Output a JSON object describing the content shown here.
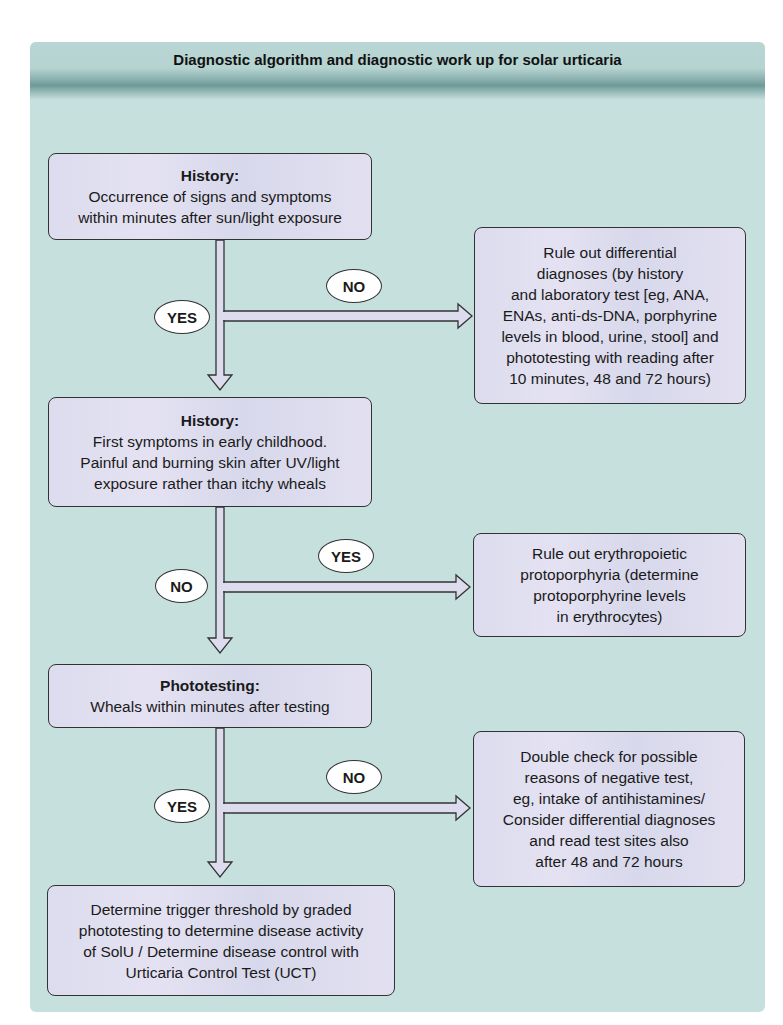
{
  "title": "Diagnostic algorithm and diagnostic work up for solar urticaria",
  "steps": [
    {
      "heading": "History:",
      "lines": [
        "Occurrence of signs and symptoms",
        "within minutes after sun/light exposure"
      ]
    },
    {
      "heading": "History:",
      "lines": [
        "First symptoms in early childhood.",
        "Painful and burning skin after UV/light",
        "exposure rather than itchy wheals"
      ]
    },
    {
      "heading": "Phototesting:",
      "lines": [
        "Wheals within minutes after testing"
      ]
    },
    {
      "heading": "",
      "lines": [
        "Determine trigger threshold by graded",
        "phototesting to determine disease activity",
        "of SolU / Determine disease control with",
        "Urticaria Control Test (UCT)"
      ]
    }
  ],
  "side_boxes": [
    {
      "lines": [
        "Rule out differential",
        "diagnoses (by history",
        "and laboratory test [eg, ANA,",
        "ENAs, anti-ds-DNA, porphyrine",
        "levels in blood, urine, stool] and",
        "phototesting with reading after",
        "10 minutes, 48 and 72 hours)"
      ]
    },
    {
      "lines": [
        "Rule out erythropoietic",
        "protoporphyria (determine",
        "protoporphyrine levels",
        "in erythrocytes)"
      ]
    },
    {
      "lines": [
        "Double check for possible",
        "reasons of negative test,",
        "eg, intake of antihistamines/",
        "Consider differential diagnoses",
        "and read test sites also",
        "after 48 and 72 hours"
      ]
    }
  ],
  "branches": [
    {
      "down_label": "YES",
      "side_label": "NO"
    },
    {
      "down_label": "NO",
      "side_label": "YES"
    },
    {
      "down_label": "YES",
      "side_label": "NO"
    }
  ],
  "colors": {
    "panel_bg": "#c6e0de",
    "box_bg": "#e0def0",
    "border": "#333333",
    "arrow_fill": "#dcdcee"
  }
}
